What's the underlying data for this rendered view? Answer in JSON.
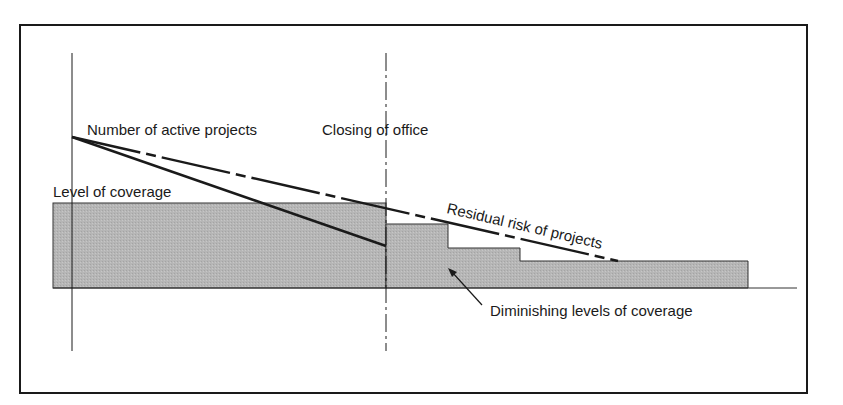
{
  "diagram": {
    "labels": {
      "active_projects": "Number of active projects",
      "closing_office": "Closing of office",
      "level_coverage": "Level of coverage",
      "residual_risk": "Residual risk of projects",
      "diminishing": "Diminishing levels of coverage"
    },
    "colors": {
      "fill": "#b4b4b4",
      "stroke": "#1a1a1a",
      "frame": "#1a1a1a",
      "background": "#ffffff"
    }
  }
}
